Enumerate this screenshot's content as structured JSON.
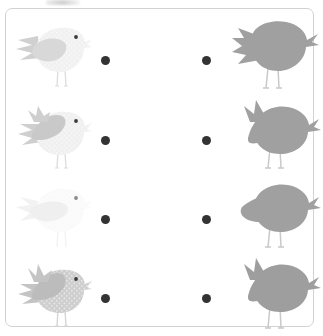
{
  "page": {
    "background_color": "#ffffff",
    "frame_color": "#d2d2d2",
    "dot_color": "#333333"
  },
  "puzzle": {
    "type": "matching-grid",
    "row_count": 4,
    "column_count": 4,
    "columns": [
      {
        "name": "left-bird-column",
        "kind": "light-bird"
      },
      {
        "name": "left-dot-column",
        "kind": "dot"
      },
      {
        "name": "right-dot-column",
        "kind": "dot"
      },
      {
        "name": "right-bird-column",
        "kind": "dark-bird"
      }
    ],
    "rows": [
      {
        "id": "row-1",
        "left_bird": {
          "name": "light-bird-tail-left",
          "pose": "tail-feathers-left",
          "body_color": "#f1f1f1",
          "wing_color": "#d8d8d8",
          "tail_color": "#d0d0d0",
          "eye_color": "#3a3a3a",
          "leg_color": "#dedede",
          "textured": true
        },
        "left_dot": {
          "name": "dot-row-1-left",
          "color": "#333333"
        },
        "right_dot": {
          "name": "dot-row-1-right",
          "color": "#333333"
        },
        "right_bird": {
          "name": "dark-bird-tail-left",
          "pose": "tail-feathers-left",
          "body_color": "#a0a0a0",
          "leg_color": "#c9c9c9",
          "textured": false
        }
      },
      {
        "id": "row-2",
        "left_bird": {
          "name": "light-bird-wing-up",
          "pose": "wing-raised",
          "body_color": "#f0f0f0",
          "wing_color": "#c9c9c9",
          "tail_color": "#cfcfcf",
          "eye_color": "#3a3a3a",
          "leg_color": "#dedede",
          "textured": true
        },
        "left_dot": {
          "name": "dot-row-2-left",
          "color": "#333333"
        },
        "right_dot": {
          "name": "dot-row-2-right",
          "color": "#333333"
        },
        "right_bird": {
          "name": "dark-bird-wing-up",
          "pose": "wing-raised",
          "body_color": "#a0a0a0",
          "leg_color": "#c9c9c9",
          "textured": false
        }
      },
      {
        "id": "row-3",
        "left_bird": {
          "name": "light-bird-wing-swept",
          "pose": "wing-swept-back",
          "body_color": "#fafafa",
          "wing_color": "#efefef",
          "tail_color": "#f2f2f2",
          "eye_color": "#8a8a8a",
          "leg_color": "#f2f2f2",
          "textured": true,
          "very_faint": true
        },
        "left_dot": {
          "name": "dot-row-3-left",
          "color": "#333333"
        },
        "right_dot": {
          "name": "dot-row-3-right",
          "color": "#333333"
        },
        "right_bird": {
          "name": "dark-bird-wing-swept",
          "pose": "wing-swept-back",
          "body_color": "#a0a0a0",
          "leg_color": "#c9c9c9",
          "textured": false
        }
      },
      {
        "id": "row-4",
        "left_bird": {
          "name": "light-bird-wing-up-gray",
          "pose": "wing-raised",
          "body_color": "#cecece",
          "wing_color": "#bcbcbc",
          "tail_color": "#c4c4c4",
          "eye_color": "#3a3a3a",
          "leg_color": "#d5d5d5",
          "textured": true
        },
        "left_dot": {
          "name": "dot-row-4-left",
          "color": "#333333"
        },
        "right_dot": {
          "name": "dot-row-4-right",
          "color": "#333333"
        },
        "right_bird": {
          "name": "dark-bird-wing-up-2",
          "pose": "wing-raised",
          "body_color": "#9e9e9e",
          "leg_color": "#c9c9c9",
          "textured": false
        }
      }
    ]
  }
}
